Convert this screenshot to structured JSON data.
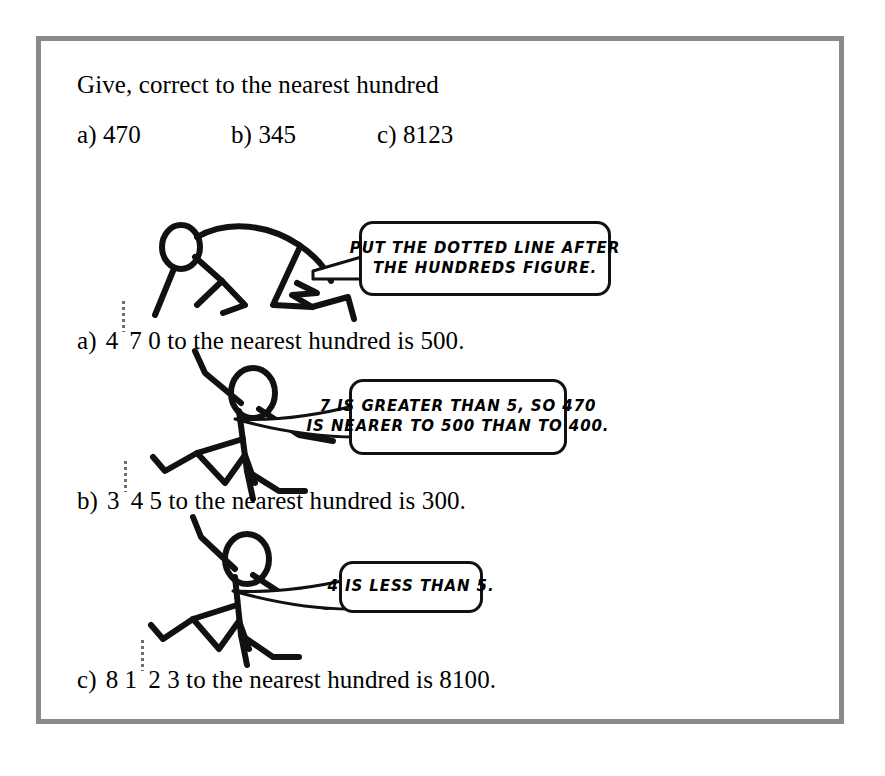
{
  "page": {
    "border_color": "#8a8a8a",
    "background": "#ffffff",
    "ink_color": "#111111",
    "dotted_line_color": "#6e6e6e"
  },
  "worksheet": {
    "prompt": "Give, correct to the nearest hundred",
    "questions": [
      {
        "label": "a)",
        "number": "470"
      },
      {
        "label": "b)",
        "number": "345"
      },
      {
        "label": "c)",
        "number": "8123"
      }
    ],
    "answers": [
      {
        "label": "a)",
        "before_dots": "4",
        "after_dots": "7 0",
        "tail": "to the nearest hundred is 500."
      },
      {
        "label": "b)",
        "before_dots": "3",
        "after_dots": "4 5",
        "tail": "to the nearest hundred is 300."
      },
      {
        "label": "c)",
        "before_dots": "8 1",
        "after_dots": "2 3",
        "tail": "to the nearest hundred is 8100."
      }
    ]
  },
  "bubbles": [
    {
      "id": "bubble-hundreds-rule",
      "lines": [
        "PUT THE DOTTED LINE AFTER",
        "THE HUNDREDS FIGURE."
      ]
    },
    {
      "id": "bubble-round-up",
      "lines": [
        "7 IS GREATER THAN 5, SO 470",
        "IS NEARER TO 500 THAN TO 400."
      ]
    },
    {
      "id": "bubble-round-down",
      "lines": [
        "4 IS LESS THAN 5."
      ]
    }
  ],
  "figures": [
    {
      "id": "figure-crouching",
      "description": "stick-figure-crouching"
    },
    {
      "id": "figure-pointing-1",
      "description": "stick-figure-pointing"
    },
    {
      "id": "figure-pointing-2",
      "description": "stick-figure-pointing"
    }
  ]
}
